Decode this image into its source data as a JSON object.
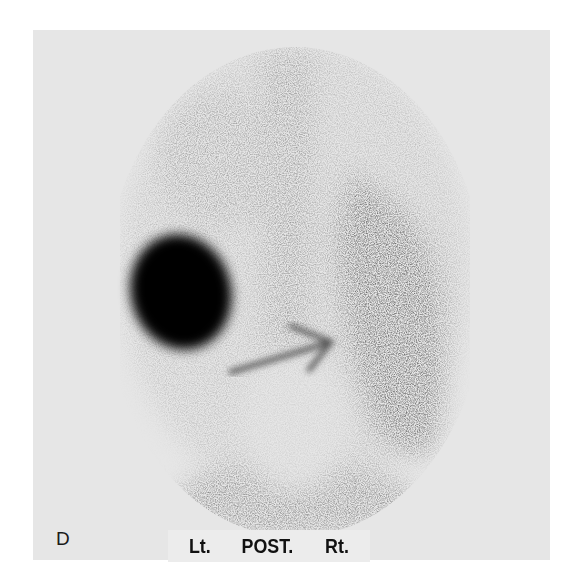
{
  "figure": {
    "panel_letter": "D",
    "view_labels": {
      "left": "Lt.",
      "center": "POST.",
      "right": "Rt."
    },
    "colors": {
      "background": "#ffffff",
      "panel_bg": "#e6e6e6",
      "uptake_dark": "#050505",
      "uptake_mid": "#5a5a5a"
    },
    "annotations": [
      {
        "type": "arrow",
        "direction": "up-right"
      }
    ]
  }
}
